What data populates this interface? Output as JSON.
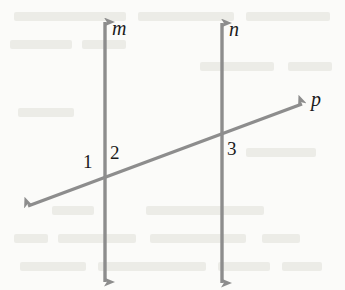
{
  "figure": {
    "background_color": "#fbfbf9",
    "stroke_color": "#8d8d8d",
    "label_color": "#1a1a1a",
    "line_labels": [
      {
        "text": "m",
        "name": "line-label-m",
        "x": 112,
        "y": 18
      },
      {
        "text": "n",
        "name": "line-label-n",
        "x": 229,
        "y": 19
      },
      {
        "text": "p",
        "name": "line-label-p",
        "x": 311,
        "y": 89
      }
    ],
    "angle_labels": [
      {
        "text": "1",
        "name": "angle-label-1",
        "x": 83,
        "y": 152
      },
      {
        "text": "2",
        "name": "angle-label-2",
        "x": 110,
        "y": 143
      },
      {
        "text": "3",
        "name": "angle-label-3",
        "x": 227,
        "y": 139
      }
    ],
    "lines": [
      {
        "name": "line-m",
        "label": "m",
        "orientation": "vertical",
        "x1": 105,
        "y1": 22,
        "x2": 105,
        "y2": 282,
        "arrow_start": true,
        "arrow_end": true
      },
      {
        "name": "line-n",
        "label": "n",
        "orientation": "vertical",
        "x1": 222,
        "y1": 23,
        "x2": 222,
        "y2": 283,
        "arrow_start": true,
        "arrow_end": true
      },
      {
        "name": "line-p",
        "label": "p",
        "orientation": "transversal",
        "x1": 28,
        "y1": 206,
        "x2": 302,
        "y2": 104,
        "arrow_start": true,
        "arrow_end": true
      }
    ],
    "intersections": [
      {
        "name": "intersection-m-p",
        "x": 105,
        "y": 178,
        "angles": [
          "1",
          "2"
        ]
      },
      {
        "name": "intersection-n-p",
        "x": 222,
        "y": 134,
        "angles": [
          "3"
        ]
      }
    ],
    "bleed_text_rows": [
      {
        "x": 14,
        "y": 12,
        "width": 112
      },
      {
        "x": 138,
        "y": 12,
        "width": 96
      },
      {
        "x": 246,
        "y": 12,
        "width": 84
      },
      {
        "x": 10,
        "y": 40,
        "width": 62
      },
      {
        "x": 82,
        "y": 40,
        "width": 44
      },
      {
        "x": 200,
        "y": 62,
        "width": 74
      },
      {
        "x": 288,
        "y": 62,
        "width": 44
      },
      {
        "x": 18,
        "y": 108,
        "width": 56
      },
      {
        "x": 246,
        "y": 148,
        "width": 70
      },
      {
        "x": 52,
        "y": 206,
        "width": 42
      },
      {
        "x": 146,
        "y": 206,
        "width": 118
      },
      {
        "x": 14,
        "y": 234,
        "width": 34
      },
      {
        "x": 58,
        "y": 234,
        "width": 78
      },
      {
        "x": 150,
        "y": 234,
        "width": 96
      },
      {
        "x": 262,
        "y": 234,
        "width": 38
      },
      {
        "x": 20,
        "y": 262,
        "width": 66
      },
      {
        "x": 98,
        "y": 262,
        "width": 108
      },
      {
        "x": 218,
        "y": 262,
        "width": 52
      },
      {
        "x": 282,
        "y": 262,
        "width": 40
      }
    ]
  }
}
